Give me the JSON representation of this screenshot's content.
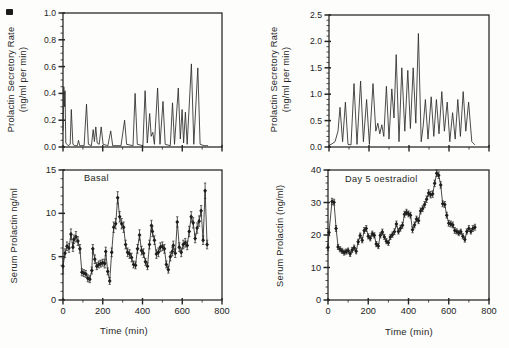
{
  "figure": {
    "background": "#fdfdfb",
    "ink": "#242424"
  },
  "chart_data": [
    {
      "id": "secretory-rate-basal",
      "type": "line",
      "ylabel_lines": [
        "Prolactin Secretory Rate",
        "(ng/ml per min)"
      ],
      "xlabel": "",
      "x_range": [
        0,
        800
      ],
      "y_range": [
        0,
        1.0
      ],
      "y_ticks": [
        0,
        0.2,
        0.4,
        0.6,
        0.8,
        1.0
      ],
      "y_tick_labels": [
        "0.0",
        "0.2",
        "0.4",
        "0.6",
        "0.8",
        "1.0"
      ],
      "y_minor_step": 0.05,
      "x_ticks": [
        0,
        200,
        400,
        600,
        800
      ],
      "x_tick_labels": [],
      "x_minor_step": 100,
      "grid": false,
      "points": [
        [
          0,
          0.12
        ],
        [
          4,
          0.45
        ],
        [
          8,
          0.3
        ],
        [
          10,
          0.42
        ],
        [
          14,
          0.03
        ],
        [
          26,
          0.01
        ],
        [
          36,
          0.02
        ],
        [
          42,
          0.28
        ],
        [
          50,
          0.02
        ],
        [
          60,
          0.01
        ],
        [
          72,
          0.01
        ],
        [
          78,
          0.05
        ],
        [
          84,
          0.01
        ],
        [
          106,
          0.01
        ],
        [
          118,
          0.32
        ],
        [
          128,
          0.02
        ],
        [
          143,
          0.01
        ],
        [
          152,
          0.13
        ],
        [
          158,
          0.04
        ],
        [
          165,
          0.15
        ],
        [
          172,
          0.03
        ],
        [
          182,
          0.02
        ],
        [
          192,
          0.15
        ],
        [
          202,
          0.02
        ],
        [
          226,
          0.01
        ],
        [
          240,
          0.12
        ],
        [
          250,
          0.01
        ],
        [
          292,
          0.01
        ],
        [
          310,
          0.2
        ],
        [
          320,
          0.02
        ],
        [
          352,
          0.01
        ],
        [
          363,
          0.4
        ],
        [
          374,
          0.02
        ],
        [
          402,
          0.01
        ],
        [
          413,
          0.42
        ],
        [
          424,
          0.03
        ],
        [
          436,
          0.25
        ],
        [
          444,
          0.08
        ],
        [
          452,
          0.11
        ],
        [
          460,
          0.02
        ],
        [
          476,
          0.44
        ],
        [
          488,
          0.02
        ],
        [
          503,
          0.34
        ],
        [
          514,
          0.02
        ],
        [
          540,
          0.01
        ],
        [
          551,
          0.33
        ],
        [
          561,
          0.02
        ],
        [
          580,
          0.44
        ],
        [
          590,
          0.06
        ],
        [
          599,
          0.28
        ],
        [
          607,
          0.03
        ],
        [
          616,
          0.26
        ],
        [
          625,
          0.02
        ],
        [
          646,
          0.62
        ],
        [
          658,
          0.02
        ],
        [
          678,
          0.59
        ],
        [
          690,
          0.02
        ],
        [
          710,
          0.01
        ],
        [
          730,
          0.01
        ]
      ]
    },
    {
      "id": "secretory-rate-oestradiol",
      "type": "line",
      "ylabel_lines": [
        "Prolactin Secretory Rate",
        "(ng/ml per min)"
      ],
      "xlabel": "",
      "x_range": [
        0,
        800
      ],
      "y_range": [
        0,
        2.5
      ],
      "y_ticks": [
        0,
        0.5,
        1.0,
        1.5,
        2.0,
        2.5
      ],
      "y_tick_labels": [
        "0.0",
        "0.5",
        "1.0",
        "1.5",
        "2.0",
        "2.5"
      ],
      "y_minor_step": 0.1,
      "x_ticks": [
        0,
        200,
        400,
        600,
        800
      ],
      "x_tick_labels": [],
      "x_minor_step": 100,
      "grid": false,
      "points": [
        [
          0,
          0.03
        ],
        [
          15,
          0.06
        ],
        [
          30,
          0.1
        ],
        [
          45,
          0.3
        ],
        [
          55,
          0.75
        ],
        [
          68,
          0.1
        ],
        [
          82,
          0.85
        ],
        [
          95,
          0.05
        ],
        [
          110,
          0.04
        ],
        [
          125,
          1.2
        ],
        [
          140,
          0.05
        ],
        [
          158,
          1.25
        ],
        [
          172,
          0.1
        ],
        [
          188,
          0.9
        ],
        [
          202,
          0.05
        ],
        [
          220,
          1.2
        ],
        [
          234,
          0.3
        ],
        [
          244,
          0.45
        ],
        [
          254,
          0.25
        ],
        [
          264,
          0.42
        ],
        [
          274,
          0.2
        ],
        [
          287,
          1.15
        ],
        [
          300,
          0.15
        ],
        [
          314,
          1.1
        ],
        [
          325,
          0.55
        ],
        [
          336,
          1.75
        ],
        [
          350,
          0.1
        ],
        [
          364,
          1.5
        ],
        [
          379,
          0.3
        ],
        [
          394,
          1.45
        ],
        [
          407,
          0.35
        ],
        [
          421,
          1.5
        ],
        [
          434,
          0.45
        ],
        [
          447,
          2.15
        ],
        [
          461,
          0.1
        ],
        [
          471,
          0.4
        ],
        [
          482,
          0.9
        ],
        [
          495,
          0.15
        ],
        [
          511,
          0.95
        ],
        [
          524,
          0.2
        ],
        [
          537,
          0.9
        ],
        [
          550,
          0.25
        ],
        [
          564,
          1.05
        ],
        [
          577,
          0.3
        ],
        [
          591,
          0.85
        ],
        [
          604,
          0.1
        ],
        [
          618,
          0.65
        ],
        [
          631,
          0.15
        ],
        [
          644,
          0.9
        ],
        [
          657,
          0.2
        ],
        [
          671,
          1.05
        ],
        [
          684,
          0.3
        ],
        [
          698,
          0.85
        ],
        [
          714,
          0.1
        ],
        [
          730,
          0.04
        ]
      ]
    },
    {
      "id": "serum-prolactin-basal",
      "type": "scatter-line",
      "annotation": "Basal",
      "ylabel": "Serum Prolactin ng/ml",
      "xlabel": "Time (min)",
      "x_range": [
        0,
        800
      ],
      "y_range": [
        0,
        15
      ],
      "y_ticks": [
        0,
        5,
        10,
        15
      ],
      "y_tick_labels": [
        "0",
        "5",
        "10",
        "15"
      ],
      "y_minor_step": 1,
      "x_ticks": [
        0,
        200,
        400,
        600,
        800
      ],
      "x_tick_labels": [
        "0",
        "200",
        "400",
        "600",
        "800"
      ],
      "x_minor_step": 100,
      "grid": false,
      "show_markers": true,
      "points": [
        [
          0,
          3.9,
          0.9
        ],
        [
          10,
          5.4,
          0.5
        ],
        [
          20,
          6.2,
          0.5
        ],
        [
          30,
          6.0,
          0.5
        ],
        [
          40,
          7.6,
          0.6
        ],
        [
          50,
          6.1,
          0.5
        ],
        [
          55,
          7.0,
          0.5
        ],
        [
          65,
          7.3,
          0.6
        ],
        [
          75,
          6.8,
          0.5
        ],
        [
          85,
          5.9,
          0.5
        ],
        [
          95,
          3.2,
          0.4
        ],
        [
          105,
          3.1,
          0.4
        ],
        [
          115,
          3.0,
          0.4
        ],
        [
          125,
          2.5,
          0.4
        ],
        [
          135,
          2.4,
          0.4
        ],
        [
          145,
          3.4,
          0.4
        ],
        [
          150,
          5.9,
          0.5
        ],
        [
          160,
          4.7,
          0.5
        ],
        [
          170,
          3.9,
          0.4
        ],
        [
          180,
          4.1,
          0.4
        ],
        [
          190,
          4.2,
          0.4
        ],
        [
          200,
          4.3,
          0.4
        ],
        [
          210,
          4.2,
          0.5
        ],
        [
          215,
          5.6,
          0.5
        ],
        [
          225,
          3.3,
          0.4
        ],
        [
          235,
          2.2,
          0.4
        ],
        [
          245,
          5.5,
          0.5
        ],
        [
          255,
          8.4,
          0.6
        ],
        [
          265,
          8.8,
          0.6
        ],
        [
          275,
          11.8,
          0.7
        ],
        [
          285,
          9.6,
          0.6
        ],
        [
          295,
          8.8,
          0.6
        ],
        [
          305,
          8.4,
          0.6
        ],
        [
          315,
          6.4,
          0.5
        ],
        [
          325,
          5.5,
          0.5
        ],
        [
          335,
          5.3,
          0.5
        ],
        [
          345,
          4.9,
          0.5
        ],
        [
          355,
          4.1,
          0.4
        ],
        [
          365,
          4.0,
          0.4
        ],
        [
          375,
          5.9,
          0.5
        ],
        [
          385,
          7.5,
          0.6
        ],
        [
          395,
          5.7,
          0.5
        ],
        [
          405,
          5.4,
          0.5
        ],
        [
          415,
          4.4,
          0.4
        ],
        [
          425,
          3.9,
          0.4
        ],
        [
          435,
          6.4,
          0.5
        ],
        [
          445,
          8.6,
          0.6
        ],
        [
          450,
          7.9,
          0.6
        ],
        [
          460,
          6.9,
          0.5
        ],
        [
          470,
          5.3,
          0.5
        ],
        [
          480,
          5.5,
          0.5
        ],
        [
          490,
          6.1,
          0.5
        ],
        [
          500,
          6.2,
          0.5
        ],
        [
          510,
          5.9,
          0.5
        ],
        [
          520,
          4.1,
          0.4
        ],
        [
          530,
          3.5,
          0.4
        ],
        [
          540,
          5.0,
          0.5
        ],
        [
          550,
          5.6,
          0.5
        ],
        [
          555,
          6.3,
          0.5
        ],
        [
          565,
          5.4,
          0.5
        ],
        [
          575,
          9.0,
          0.6
        ],
        [
          585,
          6.1,
          0.5
        ],
        [
          595,
          5.5,
          0.5
        ],
        [
          605,
          6.4,
          0.5
        ],
        [
          615,
          6.6,
          0.5
        ],
        [
          625,
          6.3,
          0.5
        ],
        [
          635,
          7.9,
          0.6
        ],
        [
          645,
          9.6,
          0.6
        ],
        [
          655,
          8.9,
          0.6
        ],
        [
          665,
          7.1,
          0.5
        ],
        [
          675,
          8.3,
          0.6
        ],
        [
          685,
          9.1,
          0.6
        ],
        [
          695,
          10.3,
          0.6
        ],
        [
          705,
          6.9,
          0.5
        ],
        [
          715,
          12.6,
          0.9
        ],
        [
          725,
          6.4,
          0.5
        ]
      ]
    },
    {
      "id": "serum-prolactin-oestradiol",
      "type": "scatter-line",
      "annotation": "Day 5 oestradiol",
      "ylabel": "Serum Prolactin (ng/ml)",
      "xlabel": "Time (min)",
      "x_range": [
        0,
        800
      ],
      "y_range": [
        0,
        40
      ],
      "y_ticks": [
        0,
        10,
        20,
        30,
        40
      ],
      "y_tick_labels": [
        "0",
        "10",
        "20",
        "30",
        "40"
      ],
      "y_minor_step": 2,
      "x_ticks": [
        0,
        200,
        400,
        600,
        800
      ],
      "x_tick_labels": [
        "0",
        "200",
        "400",
        "600",
        "800"
      ],
      "x_minor_step": 100,
      "grid": false,
      "show_markers": true,
      "points": [
        [
          0,
          16.2,
          1.0
        ],
        [
          5,
          20.8,
          1.0
        ],
        [
          20,
          30.3,
          1.0
        ],
        [
          30,
          30.1,
          0.9
        ],
        [
          40,
          22.0,
          0.9
        ],
        [
          50,
          16.3,
          0.8
        ],
        [
          60,
          15.6,
          0.8
        ],
        [
          70,
          15.1,
          0.8
        ],
        [
          80,
          14.6,
          0.8
        ],
        [
          90,
          14.9,
          0.8
        ],
        [
          100,
          15.2,
          0.8
        ],
        [
          110,
          14.2,
          0.8
        ],
        [
          120,
          15.4,
          0.8
        ],
        [
          130,
          16.1,
          0.8
        ],
        [
          140,
          15.0,
          0.8
        ],
        [
          150,
          17.9,
          0.8
        ],
        [
          160,
          19.8,
          0.8
        ],
        [
          170,
          18.4,
          0.8
        ],
        [
          180,
          21.4,
          0.9
        ],
        [
          190,
          22.0,
          0.9
        ],
        [
          200,
          19.6,
          0.8
        ],
        [
          210,
          19.0,
          0.8
        ],
        [
          220,
          20.4,
          0.8
        ],
        [
          230,
          19.9,
          0.8
        ],
        [
          240,
          17.2,
          0.8
        ],
        [
          250,
          16.6,
          0.8
        ],
        [
          260,
          19.9,
          0.8
        ],
        [
          270,
          20.9,
          0.9
        ],
        [
          280,
          19.4,
          0.8
        ],
        [
          290,
          18.1,
          0.8
        ],
        [
          300,
          17.6,
          0.8
        ],
        [
          310,
          19.4,
          0.8
        ],
        [
          320,
          20.1,
          0.8
        ],
        [
          330,
          21.0,
          0.9
        ],
        [
          340,
          23.4,
          0.9
        ],
        [
          350,
          21.1,
          0.8
        ],
        [
          360,
          22.1,
          0.9
        ],
        [
          370,
          23.0,
          0.9
        ],
        [
          380,
          26.4,
          0.9
        ],
        [
          390,
          27.0,
          0.9
        ],
        [
          400,
          26.5,
          0.9
        ],
        [
          410,
          26.1,
          0.9
        ],
        [
          420,
          21.6,
          0.9
        ],
        [
          430,
          23.1,
          0.9
        ],
        [
          440,
          24.9,
          0.9
        ],
        [
          450,
          24.4,
          0.9
        ],
        [
          460,
          27.4,
          0.9
        ],
        [
          470,
          28.1,
          0.9
        ],
        [
          480,
          29.4,
          0.9
        ],
        [
          490,
          31.0,
          1.0
        ],
        [
          500,
          32.9,
          1.0
        ],
        [
          510,
          32.4,
          1.0
        ],
        [
          520,
          32.6,
          1.0
        ],
        [
          530,
          35.9,
          1.0
        ],
        [
          540,
          39.0,
          1.0
        ],
        [
          550,
          38.4,
          1.0
        ],
        [
          560,
          35.4,
          1.0
        ],
        [
          570,
          29.6,
          0.9
        ],
        [
          580,
          29.4,
          0.9
        ],
        [
          590,
          26.1,
          0.9
        ],
        [
          600,
          23.6,
          0.9
        ],
        [
          610,
          23.4,
          0.9
        ],
        [
          620,
          23.1,
          0.9
        ],
        [
          630,
          21.4,
          0.9
        ],
        [
          640,
          21.1,
          0.8
        ],
        [
          650,
          20.6,
          0.8
        ],
        [
          660,
          21.0,
          0.8
        ],
        [
          670,
          19.6,
          0.8
        ],
        [
          680,
          18.6,
          0.8
        ],
        [
          690,
          21.1,
          0.8
        ],
        [
          700,
          22.0,
          0.9
        ],
        [
          710,
          21.1,
          0.8
        ],
        [
          720,
          22.0,
          0.9
        ],
        [
          730,
          22.4,
          0.9
        ]
      ]
    }
  ]
}
